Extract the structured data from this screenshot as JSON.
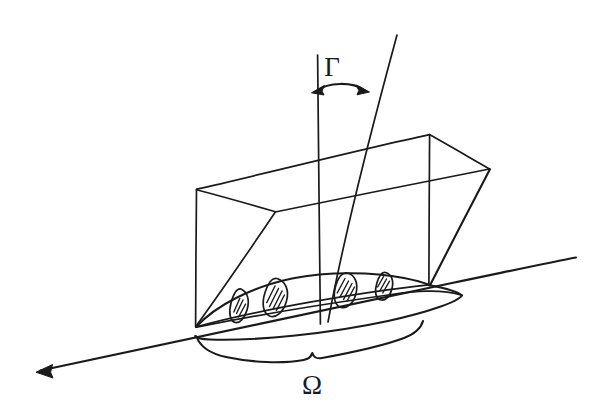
{
  "figure": {
    "background_color": "#ffffff",
    "ink_color": "#1a1a1a",
    "width": 592,
    "height": 416,
    "labels": {
      "gamma": {
        "text": "Γ",
        "name": "gamma-label",
        "x": 332,
        "y": 76,
        "description": "Interface label Gamma above a curved double-headed arrow"
      },
      "omega": {
        "text": "Ω",
        "name": "omega-label",
        "x": 312,
        "y": 394,
        "description": "Domain label Omega below a horizontal curly brace"
      }
    },
    "elements": {
      "ground_line": {
        "name": "ground-plane-line",
        "from_x": 35,
        "from_y": 372,
        "to_x": 576,
        "to_y": 257,
        "arrow_at": "start"
      },
      "box": {
        "name": "parallelepiped-box",
        "vertex_count": 7,
        "description": "Open wire-frame box with slanted top containing the domain"
      },
      "vertical_rays": {
        "name": "interface-rays",
        "count": 2,
        "description": "One vertical line and one slanted line descending from the top of the figure through the box into the domain"
      },
      "domain_curve": {
        "name": "domain-boundary-curve",
        "description": "Lens / leaf shaped closed curve representing the domain Omega on the ground plane"
      },
      "inclusions": {
        "name": "hatched-inclusions",
        "count": 4,
        "description": "Four small hatched lens-shaped inclusions inside the domain",
        "hatch_lines_per_shape": [
          3,
          4,
          4,
          3
        ]
      },
      "brace": {
        "name": "omega-curly-brace",
        "from_x": 196,
        "to_x": 423,
        "center_x": 312,
        "description": "Horizontal curly brace spanning the domain width, labelling Omega"
      },
      "gamma_arrow": {
        "name": "gamma-double-arrow",
        "from_x": 312,
        "to_x": 364,
        "y": 88,
        "description": "Curved double-headed arrow measuring the gap between the two rays"
      }
    }
  }
}
